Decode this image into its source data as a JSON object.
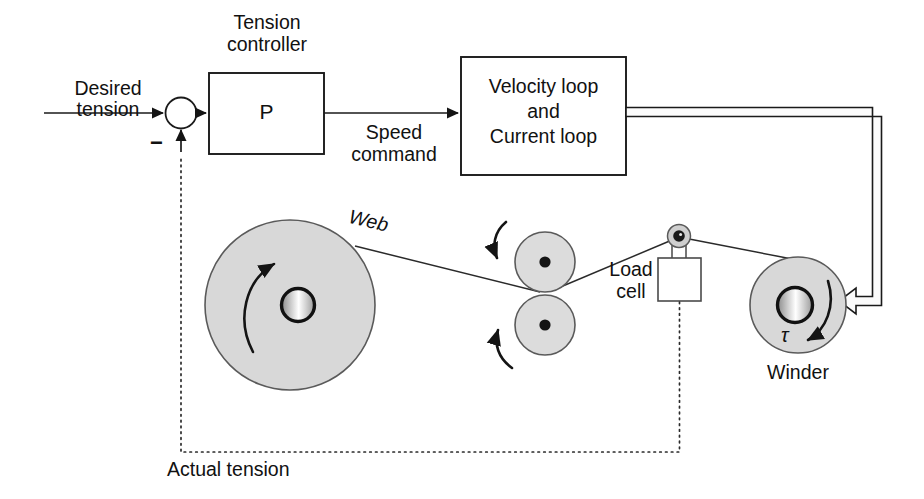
{
  "diagram": {
    "type": "control-block-diagram",
    "colors": {
      "line": "#1a1a1a",
      "roll_fill": "#d8d8d8",
      "nip_fill": "#dcdcdc",
      "background": "#ffffff",
      "dotted_feedback": "#2b2b2b"
    }
  },
  "labels": {
    "desired_tension_line1": "Desired",
    "desired_tension_line2": "tension",
    "minus_sign": "−",
    "tension_controller_line1": "Tension",
    "tension_controller_line2": "controller",
    "controller_block": "P",
    "speed_command_line1": "Speed",
    "speed_command_line2": "command",
    "velocity_block_line1": "Velocity loop",
    "velocity_block_line2": "and",
    "velocity_block_line3": "Current loop",
    "web": "Web",
    "load_cell_line1": "Load",
    "load_cell_line2": "cell",
    "winder": "Winder",
    "torque_symbol": "τ",
    "actual_tension": "Actual tension"
  },
  "blocks": [
    {
      "name": "tension-controller",
      "label": "P",
      "caption": "Tension controller"
    },
    {
      "name": "velocity-current-loop",
      "label": "Velocity loop and Current loop"
    },
    {
      "name": "load-cell",
      "label": "Load cell"
    }
  ],
  "nodes": [
    {
      "name": "summing-junction",
      "type": "circle",
      "sign": "−"
    },
    {
      "name": "unwind-roll",
      "type": "roll"
    },
    {
      "name": "nip-roller-top",
      "type": "roller"
    },
    {
      "name": "nip-roller-bottom",
      "type": "roller"
    },
    {
      "name": "load-cell-pulley",
      "type": "pulley"
    },
    {
      "name": "winder-roll",
      "type": "roll",
      "caption": "Winder",
      "torque": "τ"
    }
  ],
  "signals": [
    {
      "name": "desired-tension",
      "label": "Desired tension",
      "style": "solid"
    },
    {
      "name": "speed-command",
      "label": "Speed command",
      "style": "solid"
    },
    {
      "name": "drive-cable",
      "label": "",
      "style": "double-line"
    },
    {
      "name": "actual-tension-feedback",
      "label": "Actual tension",
      "style": "dotted"
    }
  ]
}
